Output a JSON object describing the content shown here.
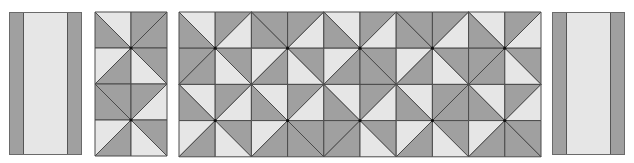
{
  "colors": {
    "dark": "#a0a0a0",
    "light": "#e6e6e6",
    "line": "#4a4a4a",
    "dot": "#111111"
  },
  "strips": [
    {
      "id": "left-strip",
      "x": 9,
      "y": 12,
      "w": 73,
      "h": 143,
      "band": 13
    },
    {
      "id": "right-strip",
      "x": 552,
      "y": 12,
      "w": 73,
      "h": 143,
      "band": 13
    }
  ],
  "grids": [
    {
      "id": "narrow-grid",
      "x": 95,
      "y": 12,
      "cols": 2,
      "rows": 4,
      "cell": 36,
      "cells": [
        [
          "\\",
          "L",
          "D"
        ],
        [
          "/",
          "D",
          "D"
        ],
        [
          "/",
          "L",
          "D"
        ],
        [
          "\\",
          "D",
          "L"
        ],
        [
          "\\",
          "D",
          "D"
        ],
        [
          "/",
          "D",
          "L"
        ],
        [
          "/",
          "L",
          "D"
        ],
        [
          "\\",
          "D",
          "L"
        ]
      ]
    },
    {
      "id": "wide-grid",
      "x": 179,
      "y": 12,
      "cols": 10,
      "rows": 4,
      "cell": 36.2,
      "cells": [
        [
          "\\",
          "L",
          "D"
        ],
        [
          "/",
          "D",
          "L"
        ],
        [
          "\\",
          "D",
          "D"
        ],
        [
          "/",
          "D",
          "L"
        ],
        [
          "\\",
          "L",
          "D"
        ],
        [
          "/",
          "D",
          "L"
        ],
        [
          "\\",
          "D",
          "D"
        ],
        [
          "/",
          "D",
          "L"
        ],
        [
          "\\",
          "L",
          "D"
        ],
        [
          "/",
          "D",
          "L"
        ],
        [
          "/",
          "D",
          "D"
        ],
        [
          "\\",
          "D",
          "L"
        ],
        [
          "/",
          "L",
          "D"
        ],
        [
          "\\",
          "D",
          "L"
        ],
        [
          "/",
          "L",
          "D"
        ],
        [
          "\\",
          "D",
          "D"
        ],
        [
          "/",
          "L",
          "D"
        ],
        [
          "\\",
          "D",
          "L"
        ],
        [
          "/",
          "D",
          "D"
        ],
        [
          "\\",
          "D",
          "L"
        ],
        [
          "\\",
          "L",
          "D"
        ],
        [
          "/",
          "D",
          "L"
        ],
        [
          "\\",
          "L",
          "D"
        ],
        [
          "/",
          "D",
          "L"
        ],
        [
          "\\",
          "L",
          "D"
        ],
        [
          "/",
          "D",
          "L"
        ],
        [
          "\\",
          "L",
          "D"
        ],
        [
          "/",
          "D",
          "D"
        ],
        [
          "\\",
          "L",
          "D"
        ],
        [
          "/",
          "D",
          "L"
        ],
        [
          "/",
          "L",
          "D"
        ],
        [
          "\\",
          "D",
          "L"
        ],
        [
          "/",
          "L",
          "D"
        ],
        [
          "\\",
          "D",
          "D"
        ],
        [
          "/",
          "D",
          "D"
        ],
        [
          "\\",
          "D",
          "L"
        ],
        [
          "/",
          "L",
          "D"
        ],
        [
          "\\",
          "D",
          "L"
        ],
        [
          "/",
          "L",
          "D"
        ],
        [
          "\\",
          "D",
          "D"
        ]
      ]
    }
  ]
}
